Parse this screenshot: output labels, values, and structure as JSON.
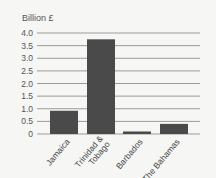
{
  "chart_data": {
    "type": "bar",
    "title": "",
    "ylabel": "Billion £",
    "xlabel": "",
    "categories": [
      "Jamaica",
      "Trinidad & Tobago",
      "Barbados",
      "The Bahamas"
    ],
    "category_lines": [
      [
        "Jamaica"
      ],
      [
        "Trinidad &",
        "Tobago"
      ],
      [
        "Barbados"
      ],
      [
        "The Bahamas"
      ]
    ],
    "values": [
      0.92,
      3.75,
      0.1,
      0.4
    ],
    "ylim": [
      0,
      4.0
    ],
    "yticks": [
      0,
      0.5,
      1.0,
      1.5,
      2.0,
      2.5,
      3.0,
      3.5,
      4.0
    ],
    "ytick_labels": [
      "0",
      "0.5",
      "1.0",
      "1.5",
      "2.0",
      "2.5",
      "3.0",
      "3.5",
      "4.0"
    ],
    "grid": true,
    "bar_color": "#4a4a4a",
    "grid_color": "#9a9a9a"
  }
}
